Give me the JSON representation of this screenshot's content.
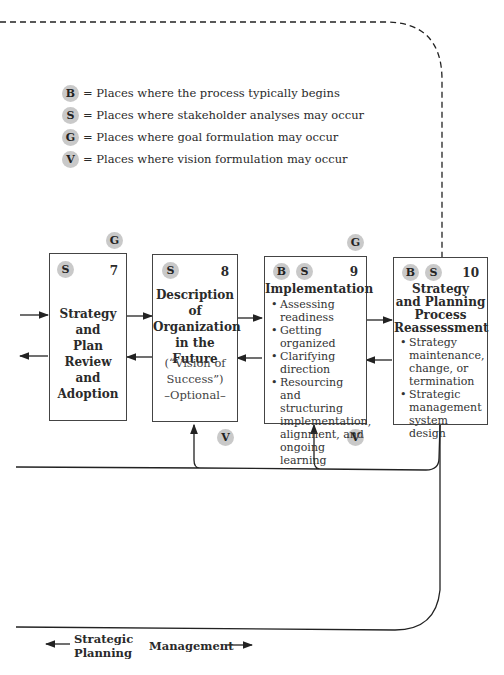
{
  "legend": [
    {
      "key": "B",
      "text": "= Places where the process typically begins"
    },
    {
      "key": "S",
      "text": "= Places where stakeholder analyses may occur"
    },
    {
      "key": "G",
      "text": "= Places where goal formulation may occur"
    },
    {
      "key": "V",
      "text": "= Places where vision formulation may occur"
    }
  ],
  "boxes": [
    {
      "number": "7",
      "badges": [
        "S"
      ],
      "title_lines": [
        "Strategy",
        "and",
        "Plan Review",
        "and",
        "Adoption"
      ]
    },
    {
      "number": "8",
      "badges": [
        "S"
      ],
      "title_lines": [
        "Description",
        "of",
        "Organization",
        "in the Future"
      ],
      "sub_lines": [
        "(“Vision of",
        "Success”)",
        "–Optional–"
      ]
    },
    {
      "number": "9",
      "badges": [
        "B",
        "S"
      ],
      "title": "Implementation",
      "bullets": [
        "Assessing readiness",
        "Getting organized",
        "Clarifying direction",
        "Resourcing and structuring implementation, alignment, and ongoing learning"
      ]
    },
    {
      "number": "10",
      "badges": [
        "B",
        "S"
      ],
      "title_lines": [
        "Strategy",
        "and Planning",
        "Process",
        "Reassessment"
      ],
      "bullets": [
        "Strategy maintenance, change, or termination",
        "Strategic management system design"
      ]
    }
  ],
  "floating_badges": {
    "g_above_7": "G",
    "g_above_9": "G",
    "v_below_8": "V",
    "v_below_9": "V"
  },
  "footer": {
    "left_line1": "Strategic",
    "left_line2": "Planning",
    "right": "Management"
  }
}
